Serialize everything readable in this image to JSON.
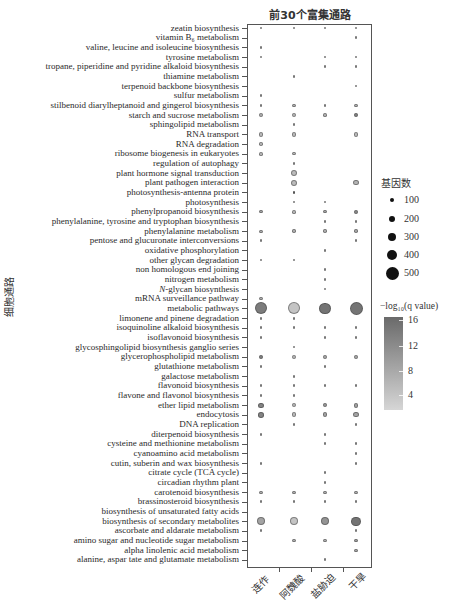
{
  "chart_data": {
    "type": "scatter",
    "subtype": "bubble-dot-plot",
    "title": "前30个富集通路",
    "xlabel": "",
    "ylabel": "细胞通路",
    "categories": [
      "连作",
      "阿魏酸",
      "盐胁迫",
      "干旱"
    ],
    "value_format": [
      "gene_count",
      "neg_log10_q_value"
    ],
    "grid": false,
    "size_legend": {
      "title": "基因数",
      "items": [
        {
          "label": "100",
          "value": 100
        },
        {
          "label": "200",
          "value": 200
        },
        {
          "label": "300",
          "value": 300
        },
        {
          "label": "400",
          "value": 400
        },
        {
          "label": "500",
          "value": 500
        }
      ]
    },
    "color_scale": {
      "title": "−log₁₀(q value)",
      "ticks": [
        {
          "label": "16",
          "value": 16
        },
        {
          "label": "12",
          "value": 12
        },
        {
          "label": "8",
          "value": 8
        },
        {
          "label": "4",
          "value": 4
        }
      ],
      "range": [
        1.8,
        16.5
      ],
      "color_low": "#d6d6d6",
      "color_high": "#606060"
    },
    "pathways": [
      {
        "label": "zeatin biosynthesis",
        "values": [
          [
            35,
            6
          ],
          [
            35,
            6
          ],
          [
            35,
            6
          ],
          [
            40,
            6
          ]
        ]
      },
      {
        "label": "vitamin B₆ metabolism",
        "values": [
          null,
          null,
          null,
          [
            35,
            6
          ]
        ]
      },
      {
        "label": "valine, leucine and isoleucine biosynthesis",
        "values": [
          [
            35,
            6
          ],
          null,
          null,
          null
        ]
      },
      {
        "label": "tyrosine metabolism",
        "values": [
          [
            35,
            6
          ],
          null,
          [
            35,
            6
          ],
          [
            40,
            6
          ]
        ]
      },
      {
        "label": "tropane, piperidine and pyridine alkaloid biosynthesis",
        "values": [
          null,
          null,
          [
            35,
            6
          ],
          [
            40,
            6
          ]
        ]
      },
      {
        "label": "thiamine metabolism",
        "values": [
          null,
          [
            35,
            6
          ],
          null,
          null
        ]
      },
      {
        "label": "terpenoid backbone biosynthesis",
        "values": [
          null,
          null,
          null,
          [
            35,
            6
          ]
        ]
      },
      {
        "label": "sulfur metabolism",
        "values": [
          [
            35,
            6
          ],
          null,
          null,
          null
        ]
      },
      {
        "label": "stilbenoid diarylheptanoid and gingerol biosynthesis",
        "values": [
          [
            45,
            6
          ],
          [
            55,
            6
          ],
          [
            45,
            6
          ],
          [
            55,
            6
          ]
        ]
      },
      {
        "label": "starch and sucrose metabolism",
        "values": [
          [
            90,
            6
          ],
          [
            120,
            5
          ],
          [
            80,
            6
          ],
          [
            110,
            12
          ]
        ]
      },
      {
        "label": "sphingolipid metabolism",
        "values": [
          null,
          [
            40,
            6
          ],
          null,
          null
        ]
      },
      {
        "label": "RNA transport",
        "values": [
          [
            110,
            5
          ],
          [
            120,
            5
          ],
          null,
          [
            120,
            5
          ]
        ]
      },
      {
        "label": "RNA degradation",
        "values": [
          [
            70,
            5
          ],
          null,
          null,
          null
        ]
      },
      {
        "label": "ribosome biogenesis in eukaryotes",
        "values": [
          [
            80,
            5
          ],
          [
            70,
            5
          ],
          null,
          null
        ]
      },
      {
        "label": "regulation of autophagy",
        "values": [
          null,
          [
            35,
            6
          ],
          null,
          null
        ]
      },
      {
        "label": "plant hormone signal transduction",
        "values": [
          null,
          [
            180,
            5
          ],
          null,
          null
        ]
      },
      {
        "label": "plant pathogen interaction",
        "values": [
          null,
          [
            180,
            5
          ],
          null,
          [
            160,
            6
          ]
        ]
      },
      {
        "label": "photosynthesis-antenna protein",
        "values": [
          null,
          [
            35,
            15
          ],
          null,
          null
        ]
      },
      {
        "label": "photosynthesis",
        "values": [
          null,
          [
            35,
            6
          ],
          [
            35,
            6
          ],
          null
        ]
      },
      {
        "label": "phenylpropanoid biosynthesis",
        "values": [
          [
            60,
            7
          ],
          [
            80,
            5
          ],
          [
            60,
            7
          ],
          [
            90,
            11
          ]
        ]
      },
      {
        "label": "phenylalanine, tyrosine and tryptophan biosynthesis",
        "values": [
          null,
          null,
          [
            35,
            6
          ],
          [
            40,
            6
          ]
        ]
      },
      {
        "label": "phenylalanine metabolism",
        "values": [
          [
            50,
            6
          ],
          [
            60,
            6
          ],
          [
            60,
            6
          ],
          [
            70,
            7
          ]
        ]
      },
      {
        "label": "pentose and glucuronate interconversions",
        "values": [
          [
            35,
            6
          ],
          null,
          null,
          [
            45,
            6
          ]
        ]
      },
      {
        "label": "oxidative phosphorylation",
        "values": [
          null,
          null,
          [
            35,
            6
          ],
          null
        ]
      },
      {
        "label": "other glycan degradation",
        "values": [
          [
            35,
            6
          ],
          [
            35,
            6
          ],
          null,
          null
        ]
      },
      {
        "label": "non homologous end joining",
        "values": [
          null,
          null,
          [
            35,
            6
          ],
          null
        ]
      },
      {
        "label": "nitrogen metabolism",
        "values": [
          null,
          null,
          [
            35,
            6
          ],
          null
        ]
      },
      {
        "label": "N-glycan biosynthesis",
        "italic_prefix": "N",
        "values": [
          null,
          null,
          [
            35,
            6
          ],
          null
        ]
      },
      {
        "label": "mRNA surveillance pathway",
        "values": [
          [
            55,
            6
          ],
          null,
          null,
          null
        ]
      },
      {
        "label": "metabolic pathways",
        "values": [
          [
            460,
            13
          ],
          [
            460,
            4
          ],
          [
            420,
            14
          ],
          [
            500,
            14
          ]
        ]
      },
      {
        "label": "limonene and pinene degradation",
        "values": [
          [
            40,
            6
          ],
          [
            40,
            6
          ],
          null,
          null
        ]
      },
      {
        "label": "isoquinoline alkaloid biosynthesis",
        "values": [
          [
            35,
            6
          ],
          [
            35,
            6
          ],
          [
            35,
            6
          ],
          [
            35,
            6
          ]
        ]
      },
      {
        "label": "isoflavonoid biosynthesis",
        "values": [
          [
            35,
            6
          ],
          null,
          [
            35,
            6
          ],
          [
            35,
            6
          ]
        ]
      },
      {
        "label": "glycosphingolipid biosynthesis ganglio series",
        "values": [
          null,
          [
            35,
            6
          ],
          null,
          null
        ]
      },
      {
        "label": "glycerophospholipid metabolism",
        "values": [
          [
            110,
            12
          ],
          [
            110,
            5
          ],
          [
            100,
            7
          ],
          [
            110,
            7
          ]
        ]
      },
      {
        "label": "glutathione metabolism",
        "values": [
          [
            35,
            6
          ],
          null,
          [
            35,
            6
          ],
          null
        ]
      },
      {
        "label": "galactose metabolism",
        "values": [
          null,
          [
            35,
            6
          ],
          null,
          null
        ]
      },
      {
        "label": "flavonoid biosynthesis",
        "values": [
          [
            45,
            6
          ],
          [
            45,
            6
          ],
          [
            45,
            6
          ],
          [
            45,
            6
          ]
        ]
      },
      {
        "label": "flavone and flavonol biosynthesis",
        "values": [
          [
            35,
            6
          ],
          [
            35,
            6
          ],
          null,
          null
        ]
      },
      {
        "label": "ether lipid metabolism",
        "values": [
          [
            140,
            12
          ],
          [
            110,
            5
          ],
          [
            110,
            9
          ],
          [
            130,
            8
          ]
        ]
      },
      {
        "label": "endocytosis",
        "values": [
          [
            160,
            12
          ],
          [
            120,
            5
          ],
          [
            130,
            8
          ],
          [
            150,
            8
          ]
        ]
      },
      {
        "label": "DNA replication",
        "values": [
          null,
          [
            35,
            6
          ],
          null,
          [
            40,
            6
          ]
        ]
      },
      {
        "label": "diterpenoid biosynthesis",
        "values": [
          [
            35,
            6
          ],
          null,
          [
            35,
            6
          ],
          null
        ]
      },
      {
        "label": "cysteine and methionine metabolism",
        "values": [
          null,
          null,
          [
            35,
            6
          ],
          [
            35,
            6
          ]
        ]
      },
      {
        "label": "cyanoamino acid metabolism",
        "values": [
          null,
          null,
          null,
          [
            40,
            6
          ]
        ]
      },
      {
        "label": "cutin, suberin and wax biosynthesis",
        "values": [
          [
            35,
            6
          ],
          null,
          null,
          [
            35,
            6
          ]
        ]
      },
      {
        "label": "citrate cycle (TCA cycle)",
        "values": [
          null,
          null,
          [
            35,
            6
          ],
          null
        ]
      },
      {
        "label": "circadian rhythm  plant",
        "values": [
          null,
          null,
          [
            35,
            6
          ],
          null
        ]
      },
      {
        "label": "carotenoid biosynthesis",
        "values": [
          [
            50,
            6
          ],
          [
            50,
            6
          ],
          [
            50,
            6
          ],
          [
            55,
            6
          ]
        ]
      },
      {
        "label": "brassinosteroid biosynthesis",
        "values": [
          [
            35,
            6
          ],
          [
            35,
            6
          ],
          [
            35,
            6
          ],
          [
            40,
            6
          ]
        ]
      },
      {
        "label": "biosynthesis of unsaturated fatty acids",
        "values": [
          null,
          null,
          null,
          null
        ]
      },
      {
        "label": "biosynthesis of secondary metabolites",
        "values": [
          [
            290,
            8
          ],
          [
            290,
            4
          ],
          [
            280,
            10
          ],
          [
            330,
            14
          ]
        ]
      },
      {
        "label": "ascorbate and aldarate metabolism",
        "values": [
          [
            35,
            6
          ],
          null,
          null,
          [
            45,
            6
          ]
        ]
      },
      {
        "label": "amino sugar and nucleotide sugar metabolism",
        "values": [
          null,
          [
            50,
            6
          ],
          [
            50,
            6
          ],
          [
            60,
            8
          ]
        ]
      },
      {
        "label": "alpha linolenic acid metabolism",
        "values": [
          null,
          null,
          null,
          [
            50,
            7
          ]
        ]
      },
      {
        "label": "alanine, aspar tate and glutamate metabolism",
        "values": [
          null,
          null,
          [
            35,
            6
          ],
          null
        ]
      }
    ]
  }
}
